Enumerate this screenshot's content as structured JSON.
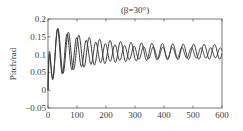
{
  "chart_data": {
    "type": "line",
    "title": "(β=30°)",
    "xlabel": "",
    "ylabel": "Pitch/rad",
    "xlim": [
      0,
      600
    ],
    "ylim": [
      -0.05,
      0.2
    ],
    "xticks": [
      0,
      100,
      200,
      300,
      400,
      500,
      600
    ],
    "yticks": [
      -0.05,
      0,
      0.05,
      0.1,
      0.15,
      0.2
    ],
    "ytick_labels": [
      "−0.05",
      "0",
      "0.05",
      "0.1",
      "0.15",
      "0.2"
    ],
    "grid": false,
    "legend": null,
    "series": [
      {
        "name": "series-1",
        "description": "damped oscillation, period ~33, settling to ~0.105 with amplitude ~0.015",
        "start": 0.0,
        "peak_first": 0.185,
        "trough_first": 0.02,
        "settle": 0.105
      },
      {
        "name": "series-2",
        "description": "damped oscillation, period ~36, settling to ~0.11 with amplitude ~0.02",
        "start": 0.0,
        "peak_first": 0.18,
        "trough_first": 0.025,
        "settle": 0.11
      }
    ]
  }
}
